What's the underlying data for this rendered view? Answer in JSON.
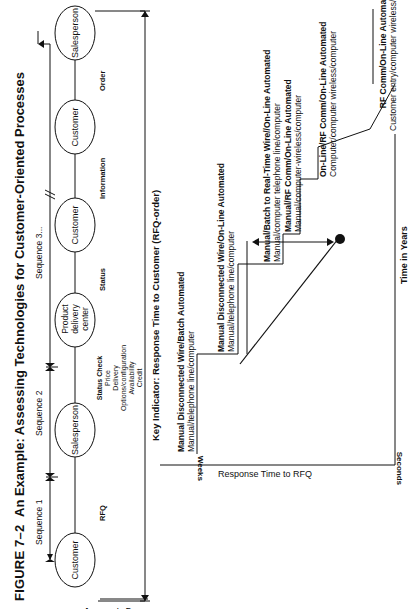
{
  "figure": {
    "number": "FIGURE 7–2",
    "title": "An Example: Assessing Technologies for Customer-Oriented Processes"
  },
  "process": {
    "side_label": "Aggregate Process",
    "sequences": [
      "Sequence 1",
      "Sequence 2",
      "Sequence 3..."
    ],
    "nodes": [
      {
        "label": "Customer"
      },
      {
        "label": "Salesperson"
      },
      {
        "label": "Product delivery center"
      },
      {
        "label": "Customer"
      },
      {
        "label": "Customer"
      },
      {
        "label": "Salesperson"
      }
    ],
    "links": [
      {
        "label": "RFQ"
      },
      {
        "label": "Status Check",
        "details": [
          "Price",
          "Delivery",
          "Options/configuration",
          "Availability",
          "Credit"
        ]
      },
      {
        "label": "Status"
      },
      {
        "label": "Information"
      },
      {
        "label": "Order"
      }
    ],
    "key_indicator": "Key Indicator: Response Time to Customer (RFQ-order)"
  },
  "chart": {
    "y_axis_label": "Response Time to RFQ",
    "y_top_label": "Weeks",
    "y_bottom_label": "Seconds",
    "x_axis_label": "Time in Years",
    "steps": [
      {
        "title": "Manual Disconnected Wire/Batch Automated",
        "subtitle": "Manual/telephone line/computer"
      },
      {
        "title": "Manual Disconnected Wire/On-Line Automated",
        "subtitle": "Manual/telephone line/computer"
      },
      {
        "title": "Manual/Batch to Real-Time Wire//On-Line Automated",
        "subtitle": "Manual/computer telephone line/computer"
      },
      {
        "title": "Manual/RF Comm/On-Line Automated",
        "subtitle": "Manual/computer-wireless/computer"
      },
      {
        "title": "On-Line/RF Comm/On-Line Automated",
        "subtitle": "Computer/computer wireless/computer"
      },
      {
        "title": "RF Comm/On-Line Automated",
        "subtitle": "Customer entry/computer wireless/computer"
      }
    ]
  }
}
